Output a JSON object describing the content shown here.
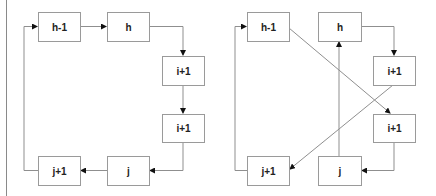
{
  "diagram": {
    "left_panel": {
      "nodes": [
        {
          "id": "h-1",
          "label": "h-1"
        },
        {
          "id": "h",
          "label": "h"
        },
        {
          "id": "i+1-a",
          "label": "i+1"
        },
        {
          "id": "i+1-b",
          "label": "i+1"
        },
        {
          "id": "j",
          "label": "j"
        },
        {
          "id": "j+1",
          "label": "j+1"
        }
      ],
      "edges": [
        {
          "from": "h-1",
          "to": "h"
        },
        {
          "from": "h",
          "to": "i+1-a"
        },
        {
          "from": "i+1-a",
          "to": "i+1-b"
        },
        {
          "from": "i+1-b",
          "to": "j"
        },
        {
          "from": "j",
          "to": "j+1"
        },
        {
          "from": "j+1",
          "to": "h-1"
        }
      ]
    },
    "right_panel": {
      "nodes": [
        {
          "id": "h-1",
          "label": "h-1"
        },
        {
          "id": "h",
          "label": "h"
        },
        {
          "id": "i+1-a",
          "label": "i+1"
        },
        {
          "id": "i+1-b",
          "label": "i+1"
        },
        {
          "id": "j",
          "label": "j"
        },
        {
          "id": "j+1",
          "label": "j+1"
        }
      ],
      "edges": [
        {
          "from": "h-1",
          "to": "i+1-b"
        },
        {
          "from": "h",
          "to": "i+1-a"
        },
        {
          "from": "i+1-a",
          "to": "j+1"
        },
        {
          "from": "i+1-b",
          "to": "j"
        },
        {
          "from": "j",
          "to": "h"
        },
        {
          "from": "j+1",
          "to": "h-1"
        }
      ]
    },
    "colors": {
      "box_border": "#9a9a9a",
      "edge": "#8f8f8f",
      "arrowhead": "#111111",
      "label": "#222222"
    }
  }
}
